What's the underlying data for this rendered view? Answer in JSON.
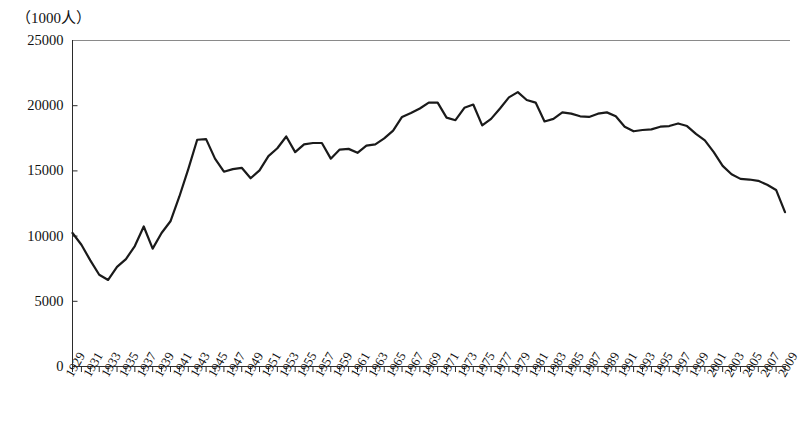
{
  "chart_data": {
    "type": "line",
    "title": "",
    "subtitle": "",
    "unit_label": "（1000人）",
    "xlabel": "",
    "ylabel": "",
    "ylim": [
      0,
      25000
    ],
    "ytick_labels": [
      "0",
      "5000",
      "10000",
      "15000",
      "20000",
      "25000"
    ],
    "ytick_values": [
      0,
      5000,
      10000,
      15000,
      20000,
      25000
    ],
    "grid": false,
    "legend": "none",
    "x_tick_label_rotation": -60,
    "x_label_interval": 2,
    "xlim": [
      1929,
      2009
    ],
    "x_tick_labels": [
      "1929",
      "1931",
      "1933",
      "1935",
      "1937",
      "1939",
      "1941",
      "1943",
      "1945",
      "1947",
      "1949",
      "1951",
      "1953",
      "1955",
      "1957",
      "1959",
      "1961",
      "1963",
      "1965",
      "1967",
      "1969",
      "1971",
      "1973",
      "1975",
      "1977",
      "1979",
      "1981",
      "1983",
      "1985",
      "1987",
      "1989",
      "1991",
      "1993",
      "1995",
      "1997",
      "1999",
      "2001",
      "2003",
      "2005",
      "2007",
      "2009"
    ],
    "x": [
      1929,
      1930,
      1931,
      1932,
      1933,
      1934,
      1935,
      1936,
      1937,
      1938,
      1939,
      1940,
      1941,
      1942,
      1943,
      1944,
      1945,
      1946,
      1947,
      1948,
      1949,
      1950,
      1951,
      1952,
      1953,
      1954,
      1955,
      1956,
      1957,
      1958,
      1959,
      1960,
      1961,
      1962,
      1963,
      1964,
      1965,
      1966,
      1967,
      1968,
      1969,
      1970,
      1971,
      1972,
      1973,
      1974,
      1975,
      1976,
      1977,
      1978,
      1979,
      1980,
      1981,
      1982,
      1983,
      1984,
      1985,
      1986,
      1987,
      1988,
      1989,
      1990,
      1991,
      1992,
      1993,
      1994,
      1995,
      1996,
      1997,
      1998,
      1999,
      2000,
      2001,
      2002,
      2003,
      2004,
      2005,
      2006,
      2007,
      2008,
      2009
    ],
    "values": [
      10200,
      9300,
      8100,
      7000,
      6600,
      7600,
      8200,
      9200,
      10700,
      9000,
      10200,
      11100,
      13000,
      15100,
      17350,
      17400,
      15900,
      14900,
      15100,
      15200,
      14400,
      15000,
      16100,
      16700,
      17600,
      16400,
      17000,
      17100,
      17100,
      15900,
      16600,
      16650,
      16350,
      16900,
      17000,
      17450,
      18050,
      19100,
      19400,
      19750,
      20200,
      20200,
      19050,
      18850,
      19800,
      20050,
      18450,
      18950,
      19750,
      20600,
      21000,
      20400,
      20200,
      18750,
      18950,
      19450,
      19350,
      19150,
      19100,
      19350,
      19450,
      19150,
      18350,
      18000,
      18100,
      18150,
      18350,
      18400,
      18600,
      18400,
      17800,
      17300,
      16400,
      15350,
      14700,
      14350,
      14300,
      14200,
      13900,
      13500,
      11800
    ]
  }
}
